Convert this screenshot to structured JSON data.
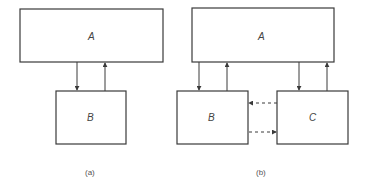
{
  "diagram": {
    "panel_a": {
      "caption": "(a)",
      "boxes": [
        {
          "id": "A",
          "label": "A"
        },
        {
          "id": "B",
          "label": "B"
        }
      ],
      "connections": [
        {
          "from": "A",
          "to": "B",
          "style": "solid"
        },
        {
          "from": "B",
          "to": "A",
          "style": "solid"
        }
      ]
    },
    "panel_b": {
      "caption": "(b)",
      "boxes": [
        {
          "id": "A",
          "label": "A"
        },
        {
          "id": "B",
          "label": "B"
        },
        {
          "id": "C",
          "label": "C"
        }
      ],
      "connections": [
        {
          "from": "A",
          "to": "B",
          "style": "solid"
        },
        {
          "from": "B",
          "to": "A",
          "style": "solid"
        },
        {
          "from": "A",
          "to": "C",
          "style": "solid"
        },
        {
          "from": "C",
          "to": "A",
          "style": "solid"
        },
        {
          "from": "C",
          "to": "B",
          "style": "dashed"
        },
        {
          "from": "B",
          "to": "C",
          "style": "dashed"
        }
      ]
    }
  }
}
